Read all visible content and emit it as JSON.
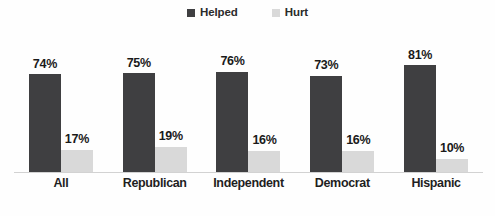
{
  "chart": {
    "type": "bar",
    "title": "",
    "background_color": "#fefefe"
  },
  "legend": {
    "position": "top-center",
    "entries": [
      {
        "label": "Helped",
        "color": "#3f3f41",
        "swatch_icon": "square-swatch-icon"
      },
      {
        "label": "Hurt",
        "color": "#d9d9d9",
        "swatch_icon": "square-swatch-icon"
      }
    ]
  },
  "axis": {
    "baseline_color": "#d2d2d2",
    "value_suffix": "%"
  },
  "chart_data": {
    "type": "bar",
    "title": "",
    "xlabel": "",
    "ylabel": "",
    "ylim": [
      0,
      100
    ],
    "grid": false,
    "legend_position": "top-center",
    "categories": [
      "All",
      "Republican",
      "Independent",
      "Democrat",
      "Hispanic"
    ],
    "series": [
      {
        "name": "Helped",
        "color": "#3f3f41",
        "values": [
          74,
          75,
          76,
          73,
          81
        ],
        "labels": [
          "74%",
          "75%",
          "76%",
          "73%",
          "81%"
        ]
      },
      {
        "name": "Hurt",
        "color": "#d9d9d9",
        "values": [
          17,
          19,
          16,
          16,
          10
        ],
        "labels": [
          "17%",
          "19%",
          "16%",
          "16%",
          "10%"
        ]
      }
    ]
  }
}
